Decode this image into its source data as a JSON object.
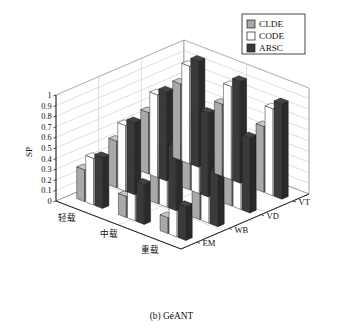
{
  "figure": {
    "caption": "(b) GéANT",
    "ylabel": "SP"
  },
  "legend": {
    "items": [
      {
        "label": "CLDE",
        "color": "#a9a9a9"
      },
      {
        "label": "CODE",
        "color": "#ffffff"
      },
      {
        "label": "ARSC",
        "color": "#3a3a3a"
      }
    ]
  },
  "axes": {
    "y_ticks": [
      "0",
      "0.1",
      "0.2",
      "0.3",
      "0.4",
      "0.5",
      "0.6",
      "0.7",
      "0.8",
      "0.9",
      "1"
    ],
    "x_categories": [
      "轻载",
      "中载",
      "重载"
    ],
    "depth_categories": [
      "EM",
      "WB",
      "VD",
      "VT"
    ]
  },
  "chart_data": {
    "type": "bar",
    "title": "(b) GéANT",
    "xlabel": "",
    "ylabel": "SP",
    "zlabel": "",
    "ylim": [
      0,
      1
    ],
    "grid": true,
    "legend_position": "top-right",
    "categories": [
      "轻载",
      "中载",
      "重载"
    ],
    "depth": [
      "EM",
      "WB",
      "VD",
      "VT"
    ],
    "series": [
      {
        "name": "CLDE",
        "color": "#a9a9a9",
        "values": {
          "EM": [
            0.3,
            0.2,
            0.15
          ],
          "WB": [
            0.44,
            0.36,
            0.3
          ],
          "VD": [
            0.58,
            0.52,
            0.45
          ],
          "VT": [
            0.72,
            0.68,
            0.62
          ]
        }
      },
      {
        "name": "CODE",
        "color": "#ffffff",
        "values": {
          "EM": [
            0.44,
            0.33,
            0.27
          ],
          "WB": [
            0.62,
            0.54,
            0.46
          ],
          "VD": [
            0.78,
            0.72,
            0.64
          ],
          "VT": [
            0.92,
            0.88,
            0.82
          ]
        }
      },
      {
        "name": "ARSC",
        "color": "#3a3a3a",
        "values": {
          "EM": [
            0.48,
            0.38,
            0.32
          ],
          "WB": [
            0.68,
            0.6,
            0.52
          ],
          "VD": [
            0.84,
            0.79,
            0.71
          ],
          "VT": [
            1.0,
            0.96,
            0.9
          ]
        }
      }
    ]
  }
}
